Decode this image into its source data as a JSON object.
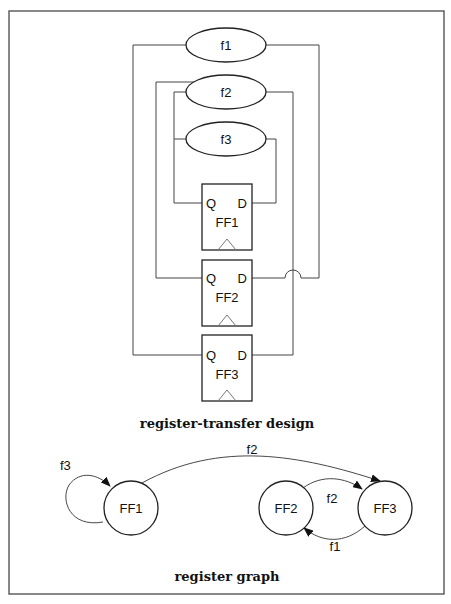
{
  "figure": {
    "rtl": {
      "caption": "register-transfer design",
      "functions": [
        {
          "id": "f1",
          "label": "f1"
        },
        {
          "id": "f2",
          "label": "f2"
        },
        {
          "id": "f3",
          "label": "f3"
        }
      ],
      "flipflops": [
        {
          "id": "FF1",
          "label": "FF1",
          "q": "Q",
          "d": "D"
        },
        {
          "id": "FF2",
          "label": "FF2",
          "q": "Q",
          "d": "D"
        },
        {
          "id": "FF3",
          "label": "FF3",
          "q": "Q",
          "d": "D"
        }
      ],
      "connections": [
        {
          "from": "FF3.Q",
          "to": "f1",
          "via": "f1",
          "target": "FF2.D"
        },
        {
          "from": "FF2.Q",
          "to": "f2",
          "target": "FF3.D"
        },
        {
          "from": "FF1.Q",
          "to": "f2"
        },
        {
          "from": "FF1.Q",
          "to": "f3",
          "target": "FF1.D"
        }
      ]
    },
    "graph": {
      "caption": "register graph",
      "nodes": [
        {
          "id": "FF1",
          "label": "FF1"
        },
        {
          "id": "FF2",
          "label": "FF2"
        },
        {
          "id": "FF3",
          "label": "FF3"
        }
      ],
      "edges": [
        {
          "from": "FF1",
          "to": "FF1",
          "label": "f3"
        },
        {
          "from": "FF1",
          "to": "FF3",
          "label": "f2"
        },
        {
          "from": "FF2",
          "to": "FF3",
          "label": "f2"
        },
        {
          "from": "FF3",
          "to": "FF2",
          "label": "f1"
        }
      ]
    }
  }
}
